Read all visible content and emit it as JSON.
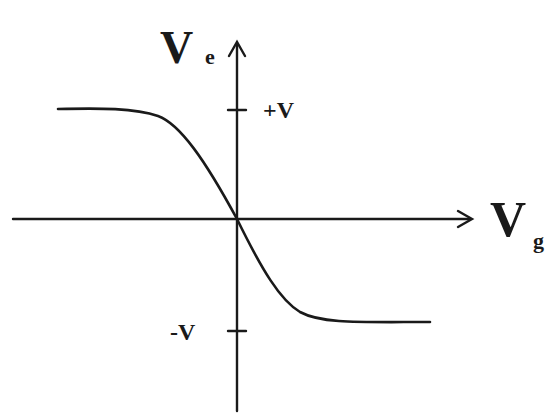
{
  "diagram": {
    "type": "transfer-characteristic",
    "y_axis": {
      "label": "V",
      "subscript": "e"
    },
    "x_axis": {
      "label": "V",
      "subscript": "g"
    },
    "ticks": {
      "positive": "+V",
      "negative": "-V"
    },
    "curve": {
      "description": "decreasing sigmoid passing through origin, saturating at +V for negative Vg and at -V for positive Vg",
      "left_saturation": "+V",
      "right_saturation": "-V"
    },
    "colors": {
      "ink": "#1a1a1a",
      "background": "#ffffff"
    }
  }
}
